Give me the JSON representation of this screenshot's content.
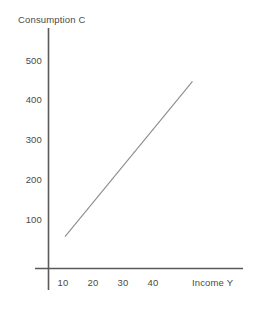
{
  "chart_data": {
    "type": "line",
    "title": "",
    "xlabel": "Income Y",
    "ylabel": "Consumption C",
    "xlim": [
      0,
      50
    ],
    "ylim": [
      0,
      540
    ],
    "grid": false,
    "legend": null,
    "x_ticks": [
      {
        "value": 10,
        "label": "10"
      },
      {
        "value": 20,
        "label": "20"
      },
      {
        "value": 30,
        "label": "30"
      },
      {
        "value": 40,
        "label": "40"
      }
    ],
    "y_ticks": [
      {
        "value": 500,
        "label": "500"
      },
      {
        "value": 400,
        "label": "400"
      },
      {
        "value": 300,
        "label": "300"
      },
      {
        "value": 200,
        "label": "200"
      },
      {
        "value": 100,
        "label": "100"
      }
    ],
    "series": [
      {
        "name": "Consumption function",
        "x": [
          5.5,
          48
        ],
        "values": [
          80,
          470
        ],
        "color": "#8c8c8c",
        "style": "solid"
      }
    ],
    "axis_color": "#5a5a5a",
    "text_color": "#4a4a4a"
  },
  "labels": {
    "y_axis_title": "Consumption C",
    "x_axis_title": "Income Y",
    "y_500": "500",
    "y_400": "400",
    "y_300": "300",
    "y_200": "200",
    "y_100": "100",
    "x_10": "10",
    "x_20": "20",
    "x_30": "30",
    "x_40": "40"
  }
}
